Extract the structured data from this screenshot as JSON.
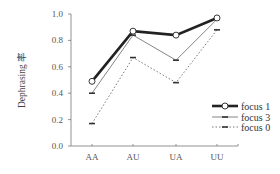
{
  "chart_data": {
    "type": "line",
    "title": "",
    "xlabel": "",
    "ylabel": "Dephrasing 率",
    "categories": [
      "AA",
      "AU",
      "UA",
      "UU"
    ],
    "ylim": [
      0.0,
      1.0
    ],
    "yticks": [
      "0.0",
      "0.2",
      "0.4",
      "0.6",
      "0.8",
      "1.0"
    ],
    "grid": false,
    "legend_position": "lower right",
    "series": [
      {
        "name": "focus 1",
        "values": [
          0.49,
          0.87,
          0.84,
          0.97
        ],
        "style": "thick-solid",
        "marker": "circle",
        "color": "#222222"
      },
      {
        "name": "focus 3",
        "values": [
          0.4,
          0.84,
          0.65,
          0.96
        ],
        "style": "thin-solid",
        "marker": "dash",
        "color": "#666666"
      },
      {
        "name": "focus 0",
        "values": [
          0.17,
          0.67,
          0.48,
          0.88
        ],
        "style": "dotted",
        "marker": "dash",
        "color": "#555555"
      }
    ]
  }
}
